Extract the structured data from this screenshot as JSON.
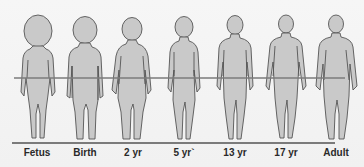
{
  "diagram": {
    "colors": {
      "background": "#f4f4f4",
      "figure_fill": "#c9c9c9",
      "figure_outline": "#555555",
      "reference_line": "#7b7b7b",
      "label_text": "#2a2a2a"
    },
    "stages": [
      {
        "label": "Fetus",
        "x": 37
      },
      {
        "label": "Birth",
        "x": 85
      },
      {
        "label": "2 yr",
        "x": 133
      },
      {
        "label": "5 yr`",
        "x": 184
      },
      {
        "label": "13 yr",
        "x": 235
      },
      {
        "label": "17 yr",
        "x": 286
      },
      {
        "label": "Adult",
        "x": 336
      }
    ]
  }
}
